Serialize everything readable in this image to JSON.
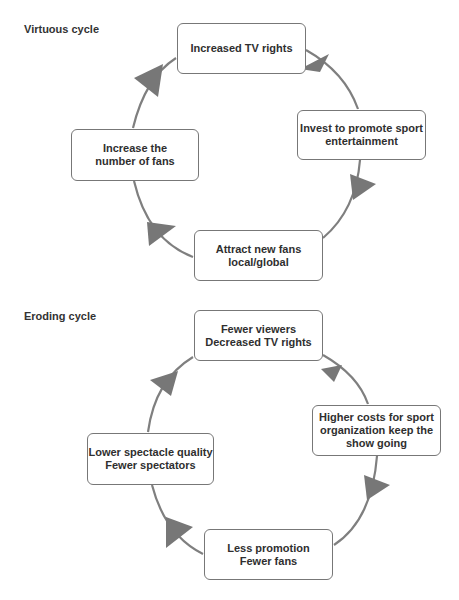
{
  "virtuous": {
    "title": "Virtuous cycle",
    "nodes": [
      {
        "label": "Increased TV rights"
      },
      {
        "label": "Invest to promote sport\nentertainment"
      },
      {
        "label": "Attract new fans\nlocal/global"
      },
      {
        "label": "Increase the\nnumber of fans"
      }
    ]
  },
  "eroding": {
    "title": "Eroding cycle",
    "nodes": [
      {
        "label": "Fewer viewers\nDecreased TV rights"
      },
      {
        "label": "Higher costs for sport\norganization keep the\nshow going"
      },
      {
        "label": "Less promotion\nFewer fans"
      },
      {
        "label": "Lower spectacle quality\nFewer spectators"
      }
    ]
  },
  "colors": {
    "arc": "#7a7a7a",
    "arrow": "#777777",
    "box_border": "#777777"
  }
}
